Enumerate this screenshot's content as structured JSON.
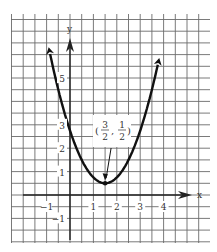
{
  "chart_data": {
    "type": "line",
    "title": "",
    "function": "y = (x - 3/2)^2 + 1/2",
    "xlabel": "x",
    "ylabel": "y",
    "xlim": [
      -2.5,
      6
    ],
    "ylim": [
      -2,
      7.8
    ],
    "grid": true,
    "grid_step": 0.5,
    "x_ticks": [
      {
        "value": -1,
        "label": "−1"
      },
      {
        "value": 1,
        "label": "1"
      },
      {
        "value": 2,
        "label": "2"
      },
      {
        "value": 3,
        "label": "3"
      },
      {
        "value": 4,
        "label": "4"
      }
    ],
    "y_ticks": [
      {
        "value": -1,
        "label": "−1"
      },
      {
        "value": 1,
        "label": "1"
      },
      {
        "value": 2,
        "label": "2"
      },
      {
        "value": 3,
        "label": "3"
      },
      {
        "value": 5,
        "label": "5"
      }
    ],
    "vertex": {
      "x": 1.5,
      "y": 0.5,
      "label_num_x": "3",
      "label_den_x": "2",
      "label_num_y": "1",
      "label_den_y": "2"
    },
    "series": [
      {
        "name": "parabola",
        "x": [
          -0.85,
          -0.5,
          0,
          0.5,
          1,
          1.5,
          2,
          2.5,
          3,
          3.5,
          3.75
        ],
        "values": [
          6.02,
          4.5,
          2.75,
          1.5,
          0.75,
          0.5,
          0.75,
          1.5,
          2.75,
          4.5,
          5.56
        ]
      }
    ],
    "annotations": [
      "(3/2, 1/2) with arrow pointing to vertex"
    ]
  },
  "colors": {
    "grid": "#6b6b6b",
    "axis": "#222222",
    "curve": "#111111"
  }
}
